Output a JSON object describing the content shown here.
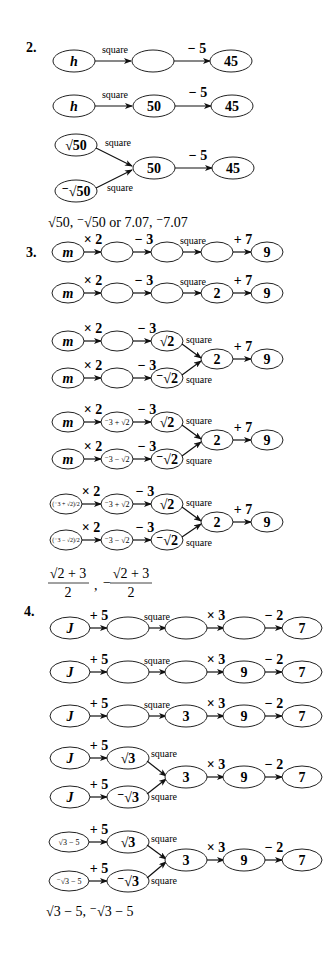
{
  "problems": [
    {
      "number": "2.",
      "answer": "√50, ⁻√50 or 7.07, ⁻7.07",
      "rows": [
        {
          "nodes": [
            "h",
            "",
            "45"
          ],
          "ops": [
            "square",
            "− 5"
          ]
        },
        {
          "nodes": [
            "h",
            "50",
            "45"
          ],
          "ops": [
            "square",
            "− 5"
          ]
        },
        {
          "branch_top": [
            "√50"
          ],
          "branch_bottom": [
            "⁻√50"
          ],
          "merge_op": "square",
          "nodes": [
            "50",
            "45"
          ],
          "ops": [
            "− 5"
          ]
        }
      ]
    },
    {
      "number": "3.",
      "answer_parts": [
        "(√2 + 3) / 2",
        "−(√2 + 3) / 2"
      ],
      "answer_display": {
        "a_num": "√2 + 3",
        "a_den": "2",
        "b_sign": "−",
        "b_num": "√2 + 3",
        "b_den": "2"
      },
      "rows": [
        {
          "nodes": [
            "m",
            "",
            "",
            "",
            "9"
          ],
          "ops": [
            "× 2",
            "− 3",
            "square",
            "+ 7"
          ]
        },
        {
          "nodes": [
            "m",
            "",
            "",
            "2",
            "9"
          ],
          "ops": [
            "× 2",
            "− 3",
            "square",
            "+ 7"
          ]
        },
        {
          "branch_top": [
            "m",
            "",
            "√2"
          ],
          "branch_bottom": [
            "m",
            "",
            "⁻√2"
          ],
          "merge_op": "square",
          "nodes": [
            "2",
            "9"
          ],
          "ops": [
            "× 2",
            "− 3",
            "+ 7"
          ]
        },
        {
          "branch_top": [
            "m",
            "⁻3 + √2",
            "√2"
          ],
          "branch_bottom": [
            "m",
            "⁻3 − √2",
            "⁻√2"
          ],
          "merge_op": "square",
          "nodes": [
            "2",
            "9"
          ],
          "ops": [
            "× 2",
            "− 3",
            "+ 7"
          ]
        },
        {
          "branch_top": [
            "(⁻3 + √2)/2",
            "⁻3 + √2",
            "√2"
          ],
          "branch_bottom": [
            "(⁻3 − √2)/2",
            "⁻3 − √2",
            "⁻√2"
          ],
          "merge_op": "square",
          "nodes": [
            "2",
            "9"
          ],
          "ops": [
            "× 2",
            "− 3",
            "+ 7"
          ]
        }
      ]
    },
    {
      "number": "4.",
      "answer": "√3 − 5, ⁻√3 − 5",
      "rows": [
        {
          "nodes": [
            "J",
            "",
            "",
            "",
            "7"
          ],
          "ops": [
            "+ 5",
            "square",
            "× 3",
            "− 2"
          ]
        },
        {
          "nodes": [
            "J",
            "",
            "",
            "9",
            "7"
          ],
          "ops": [
            "+ 5",
            "square",
            "× 3",
            "− 2"
          ]
        },
        {
          "nodes": [
            "J",
            "",
            "3",
            "9",
            "7"
          ],
          "ops": [
            "+ 5",
            "square",
            "× 3",
            "− 2"
          ]
        },
        {
          "branch_top": [
            "J",
            "√3"
          ],
          "branch_bottom": [
            "J",
            "⁻√3"
          ],
          "merge_op": "square",
          "nodes": [
            "3",
            "9",
            "7"
          ],
          "ops": [
            "+ 5",
            "× 3",
            "− 2"
          ]
        },
        {
          "branch_top": [
            "√3 − 5",
            "√3"
          ],
          "branch_bottom": [
            "⁻√3 − 5",
            "⁻√3"
          ],
          "merge_op": "square",
          "nodes": [
            "3",
            "9",
            "7"
          ],
          "ops": [
            "+ 5",
            "× 3",
            "− 2"
          ]
        }
      ]
    }
  ]
}
